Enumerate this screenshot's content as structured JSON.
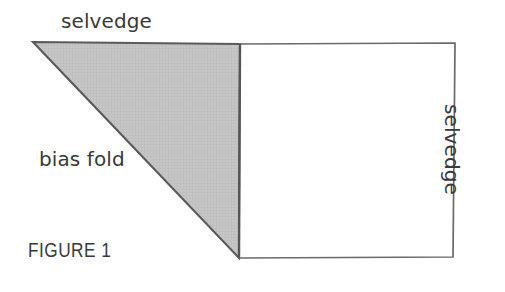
{
  "figure": {
    "caption": "FIGURE 1",
    "labels": {
      "selvedge_top": "selvedge",
      "selvedge_right": "selvedge",
      "bias_fold": "bias fold"
    },
    "colors": {
      "background": "#ffffff",
      "fabric_fill": "#c4c4c4",
      "outline": "#5a5a5a",
      "fold_line": "#555555",
      "text": "#3a3a3a"
    },
    "geometry": {
      "triangle_points": "33,42 240,44 239,258",
      "rectangle_points": "240,44 455,43 453,257 239,258",
      "fold_line": {
        "x1": 240,
        "y1": 44,
        "x2": 239,
        "y2": 258
      }
    }
  }
}
